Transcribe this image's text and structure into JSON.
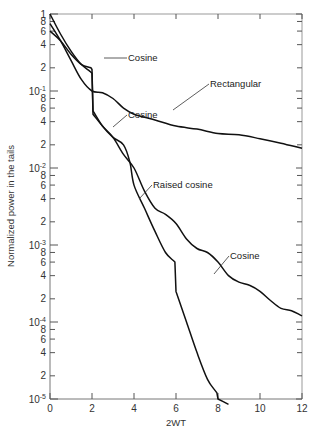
{
  "chart_data": {
    "type": "line",
    "title": "",
    "xlabel": "2WT",
    "ylabel": "Normalized power in the tails",
    "xlim": [
      0,
      12
    ],
    "ylim": [
      1e-05,
      1
    ],
    "yscale": "log",
    "grid": false,
    "legend": "none (curves labeled directly with annotations)",
    "x_ticks": [
      "0",
      "2",
      "4",
      "6",
      "8",
      "10",
      "12"
    ],
    "y_decade_labels": [
      "1",
      "10^-1",
      "10^-2",
      "10^-3",
      "10^-4",
      "10^-5"
    ],
    "y_minor_labels": [
      "8",
      "6",
      "4",
      "2"
    ],
    "series": [
      {
        "name": "Rectangular",
        "x": [
          0,
          0.5,
          1,
          1.5,
          2,
          2.5,
          3,
          3.5,
          4,
          5,
          6,
          7,
          8,
          9,
          10,
          11,
          12
        ],
        "values": [
          0.75,
          0.45,
          0.25,
          0.14,
          0.1,
          0.095,
          0.08,
          0.06,
          0.05,
          0.042,
          0.035,
          0.032,
          0.028,
          0.027,
          0.024,
          0.021,
          0.018
        ]
      },
      {
        "name": "Cosine",
        "x": [
          0,
          0.5,
          1,
          1.5,
          1.9,
          2,
          2.05,
          2.5,
          3,
          3.5,
          4,
          4.5,
          5,
          5.5,
          6,
          6.5,
          7,
          7.5,
          8,
          8.5,
          9,
          9.5,
          10,
          10.5,
          11,
          11.5,
          12
        ],
        "values": [
          1.0,
          0.55,
          0.33,
          0.22,
          0.18,
          0.17,
          0.05,
          0.035,
          0.025,
          0.015,
          0.01,
          0.005,
          0.003,
          0.0025,
          0.0019,
          0.0012,
          0.0009,
          0.0008,
          0.0006,
          0.0004,
          0.00033,
          0.0003,
          0.00025,
          0.00019,
          0.00015,
          0.00014,
          0.00012
        ]
      },
      {
        "name": "Raised cosine",
        "x": [
          0,
          0.5,
          1,
          1.5,
          1.95,
          2,
          2.05,
          2.5,
          3,
          3.5,
          3.8,
          4,
          4.5,
          5,
          5.5,
          5.95,
          6,
          6.5,
          7,
          7.5,
          7.95,
          8,
          8.5
        ],
        "values": [
          0.6,
          0.45,
          0.3,
          0.22,
          0.2,
          0.19,
          0.055,
          0.035,
          0.025,
          0.02,
          0.012,
          0.006,
          0.003,
          0.0015,
          0.0008,
          0.0006,
          0.00025,
          0.0001,
          4e-05,
          1.8e-05,
          1.2e-05,
          1e-05,
          8.5e-06
        ]
      }
    ],
    "annotations": [
      {
        "text": "Cosine",
        "x": 2.0,
        "y": 0.18
      },
      {
        "text": "Rectangular",
        "x": 6.5,
        "y": 0.035
      },
      {
        "text": "Cosine",
        "x": 2.5,
        "y": 0.035
      },
      {
        "text": "Raised cosine",
        "x": 4.2,
        "y": 0.006
      },
      {
        "text": "Cosine",
        "x": 7.6,
        "y": 0.0008
      }
    ]
  },
  "axes": {
    "xlabel": "2WT",
    "ylabel": "Normalized power in the tails"
  }
}
